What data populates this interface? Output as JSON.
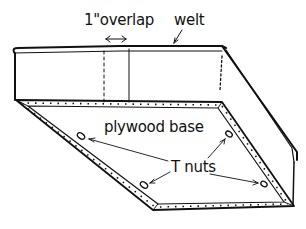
{
  "diagram": {
    "type": "cushion construction sketch",
    "labels": {
      "overlap": "1\"overlap",
      "welt": "welt",
      "base": "plywood base",
      "tnuts": "T nuts"
    },
    "colors": {
      "ink": "#111111",
      "background": "#ffffff"
    },
    "parts": [
      "welt",
      "boxing strip with 1 inch overlap seam",
      "plywood base",
      "T nuts (4)"
    ]
  }
}
